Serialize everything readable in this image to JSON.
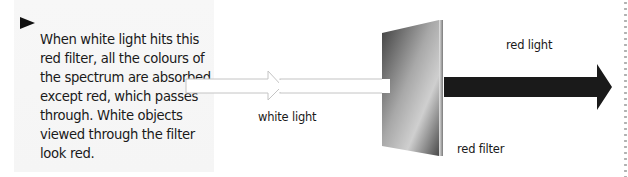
{
  "description": {
    "bullet_icon": "triangle-right-bullet",
    "text": "When white light hits this red filter, all the colours of the spectrum are absorbed except red, which passes through. White objects viewed through the filter look red."
  },
  "labels": {
    "white_light": "white light",
    "red_light": "red light",
    "red_filter": "red filter"
  },
  "colors": {
    "outgoing_beam": "#1a1a1a",
    "incoming_beam_fill": "#ffffff",
    "incoming_beam_stroke": "#bfbfbf",
    "filter_dark": "#3a3a3a",
    "filter_light": "#d8d8d8",
    "panel_background": "#f6f6f6",
    "dotted_rule": "#b0b0b0"
  }
}
